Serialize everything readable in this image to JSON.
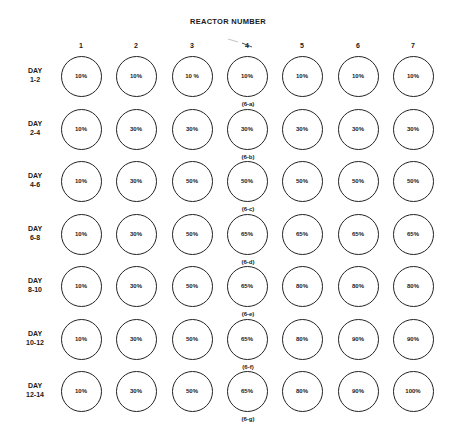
{
  "title": "REACTOR NUMBER",
  "columns": [
    "1",
    "2",
    "3",
    "4",
    "5",
    "6",
    "7"
  ],
  "rows": [
    {
      "day": "DAY",
      "range": "1-2",
      "values": [
        "10%",
        "10%",
        "10 %",
        "10%",
        "10%",
        "10%",
        "10%"
      ],
      "sublabel": "(6-a)"
    },
    {
      "day": "DAY",
      "range": "2-4",
      "values": [
        "10%",
        "30%",
        "30%",
        "30%",
        "30%",
        "30%",
        "30%"
      ],
      "sublabel": "(6-b)"
    },
    {
      "day": "DAY",
      "range": "4-6",
      "values": [
        "10%",
        "30%",
        "50%",
        "50%",
        "50%",
        "50%",
        "50%"
      ],
      "sublabel": "(6-c)"
    },
    {
      "day": "DAY",
      "range": "6-8",
      "values": [
        "10%",
        "30%",
        "50%",
        "65%",
        "65%",
        "65%",
        "65%"
      ],
      "sublabel": "(6-d)"
    },
    {
      "day": "DAY",
      "range": "8-10",
      "values": [
        "10%",
        "30%",
        "50%",
        "65%",
        "80%",
        "80%",
        "80%"
      ],
      "sublabel": "(6-e)"
    },
    {
      "day": "DAY",
      "range": "10-12",
      "values": [
        "10%",
        "30%",
        "50%",
        "65%",
        "80%",
        "90%",
        "90%"
      ],
      "sublabel": "(6-f)"
    },
    {
      "day": "DAY",
      "range": "12-14",
      "values": [
        "10%",
        "30%",
        "50%",
        "65%",
        "80%",
        "90%",
        "100%"
      ],
      "sublabel": "(6-g)"
    }
  ]
}
